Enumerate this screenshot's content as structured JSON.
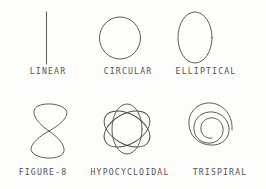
{
  "page": {
    "background_color": "#fdfdfc",
    "ink_color": "#4a4a4a",
    "caption_color": "#545454",
    "width": 266,
    "height": 189
  },
  "figures": [
    {
      "id": "linear",
      "caption": "LINEAR",
      "shape": "vertical-line",
      "row": 1,
      "column": 1
    },
    {
      "id": "circular",
      "caption": "CIRCULAR",
      "shape": "circle",
      "row": 1,
      "column": 2
    },
    {
      "id": "elliptical",
      "caption": "ELLIPTICAL",
      "shape": "ellipse",
      "row": 1,
      "column": 3
    },
    {
      "id": "figure-8",
      "caption": "FIGURE-8",
      "shape": "lemniscate",
      "row": 2,
      "column": 1
    },
    {
      "id": "hypocycloidal",
      "caption": "HYPOCYCLOIDAL",
      "shape": "three-overlapping-ellipses",
      "row": 2,
      "column": 2
    },
    {
      "id": "trispiral",
      "caption": "TRISPIRAL",
      "shape": "spiral-three-turns",
      "row": 2,
      "column": 3
    }
  ]
}
